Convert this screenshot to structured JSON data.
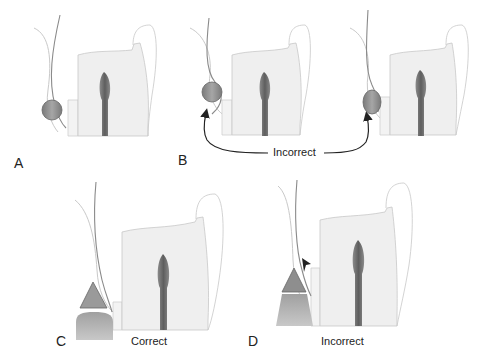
{
  "panels": [
    {
      "id": "A",
      "label": "A",
      "caption": ""
    },
    {
      "id": "B",
      "label": "B",
      "caption": "Incorrect"
    },
    {
      "id": "C",
      "label": "C",
      "caption": "Correct"
    },
    {
      "id": "D",
      "label": "D",
      "caption": "Incorrect"
    }
  ],
  "colors": {
    "tooth_fill": "#efefef",
    "tooth_outline": "#c8c8c8",
    "pulp": "#6f6f6f",
    "tissue_line": "#8a8a8a",
    "cord_fill": "#8e8e8e",
    "arrow": "#222222",
    "label_text": "#222222"
  }
}
